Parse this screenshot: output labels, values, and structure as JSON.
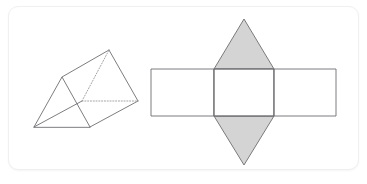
{
  "figure": {
    "card": {
      "background_color": "#ffffff",
      "border_color": "#f0f0f0",
      "corner_radius": 10
    },
    "colors": {
      "edge_stroke": "#6e6e73",
      "hidden_edge_stroke": "#9a9a9f",
      "shaded_face_fill": "#d4d4d4",
      "white_face_fill": "#ffffff"
    },
    "solid": {
      "name": "triangular-prism",
      "label": "Triangular prism (3D view)",
      "vertices": {
        "front_bottom_left": [
          34,
          127
        ],
        "front_apex": [
          62,
          77
        ],
        "front_bottom_right": [
          90,
          127
        ],
        "back_bottom_left": [
          82,
          101
        ],
        "back_apex": [
          109,
          50
        ],
        "back_bottom_right": [
          138,
          101
        ]
      },
      "visible_edges": [
        [
          [
            34,
            127
          ],
          [
            62,
            77
          ]
        ],
        [
          [
            62,
            77
          ],
          [
            90,
            127
          ]
        ],
        [
          [
            34,
            127
          ],
          [
            90,
            127
          ]
        ],
        [
          [
            62,
            77
          ],
          [
            109,
            50
          ]
        ],
        [
          [
            90,
            127
          ],
          [
            138,
            101
          ]
        ],
        [
          [
            109,
            50
          ],
          [
            138,
            101
          ]
        ],
        [
          [
            34,
            127
          ],
          [
            82,
            101
          ]
        ]
      ],
      "hidden_edges": [
        [
          [
            82,
            101
          ],
          [
            109,
            50
          ]
        ],
        [
          [
            82,
            101
          ],
          [
            138,
            101
          ]
        ]
      ]
    },
    "net": {
      "name": "triangular-prism-net",
      "label": "Net of the triangular prism (unfolded)",
      "rectangle_band": {
        "left": 151,
        "top": 69,
        "right": 336,
        "bottom": 116,
        "fold_x_left": 214,
        "fold_x_right": 274
      },
      "faces": [
        {
          "name": "left-rectangle",
          "shape": "rectangle",
          "fill": "white",
          "points": [
            [
              151,
              69
            ],
            [
              214,
              69
            ],
            [
              214,
              116
            ],
            [
              151,
              116
            ]
          ]
        },
        {
          "name": "middle-rectangle",
          "shape": "rectangle",
          "fill": "white",
          "points": [
            [
              214,
              69
            ],
            [
              274,
              69
            ],
            [
              274,
              116
            ],
            [
              214,
              116
            ]
          ]
        },
        {
          "name": "right-rectangle",
          "shape": "rectangle",
          "fill": "white",
          "points": [
            [
              274,
              69
            ],
            [
              336,
              69
            ],
            [
              336,
              116
            ],
            [
              274,
              116
            ]
          ]
        },
        {
          "name": "top-triangle",
          "shape": "triangle",
          "fill": "shaded",
          "points": [
            [
              214,
              69
            ],
            [
              244,
              19
            ],
            [
              274,
              69
            ]
          ]
        },
        {
          "name": "bottom-triangle",
          "shape": "triangle",
          "fill": "shaded",
          "points": [
            [
              214,
              116
            ],
            [
              274,
              116
            ],
            [
              244,
              165
            ]
          ]
        }
      ]
    }
  }
}
